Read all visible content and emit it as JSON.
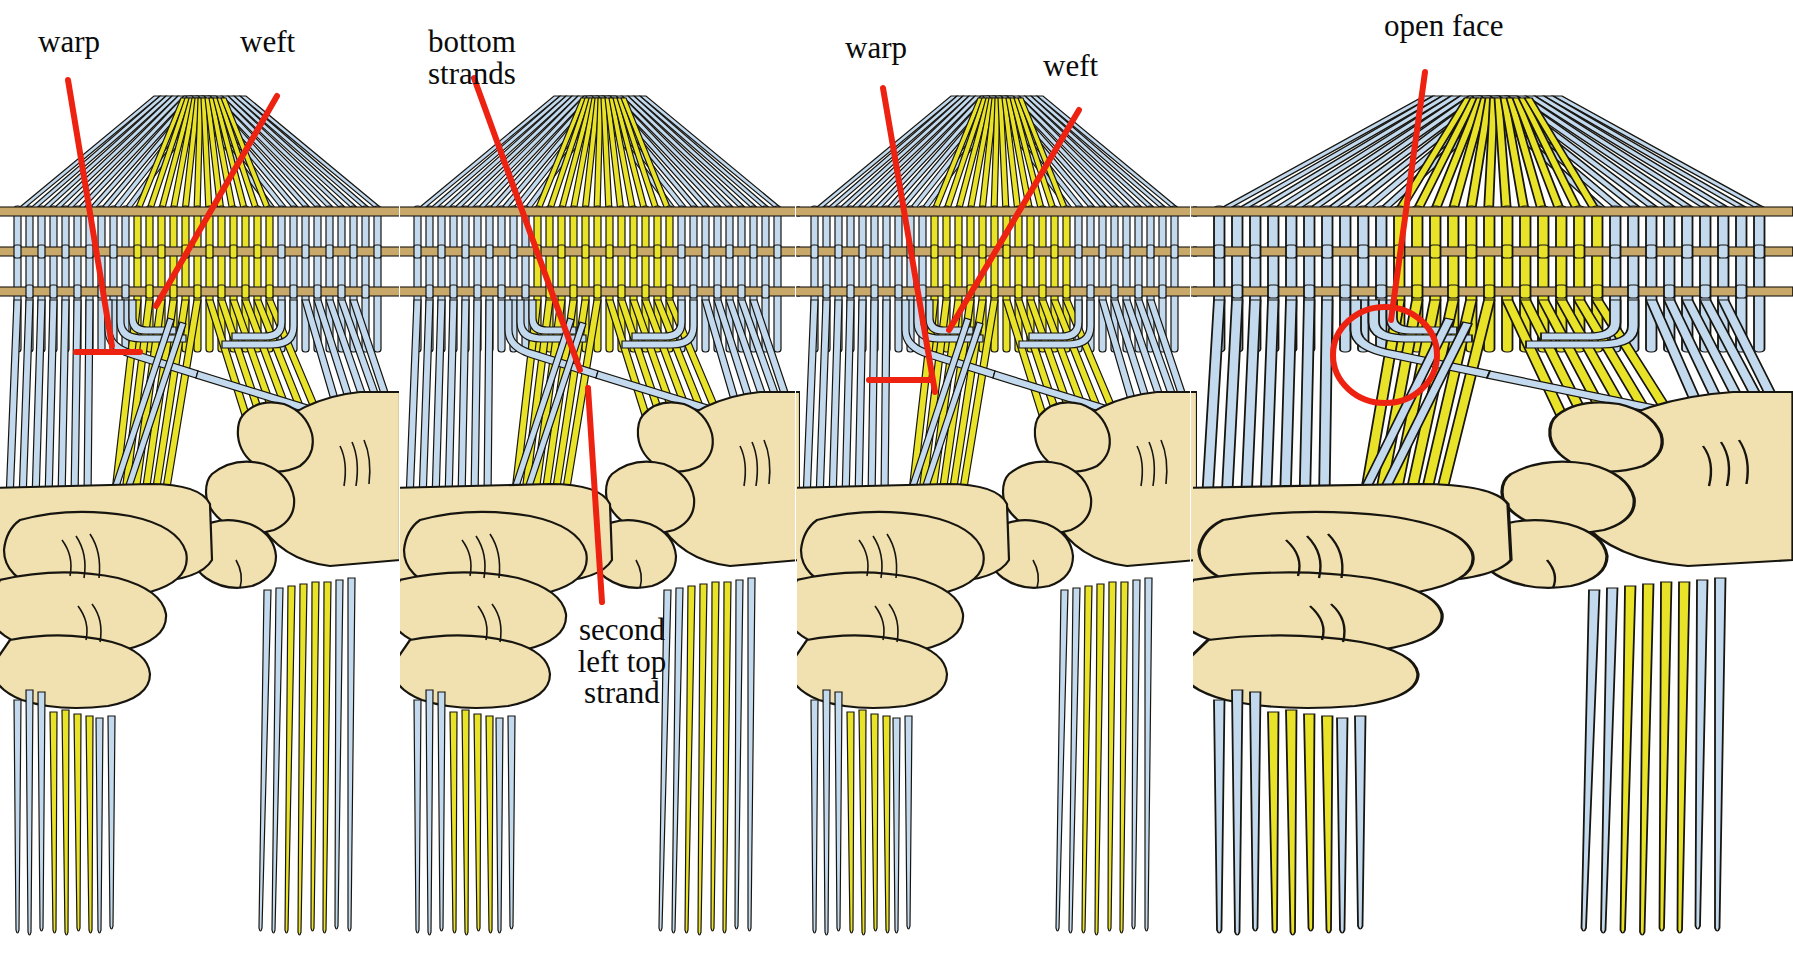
{
  "figure": {
    "panel_count": 4,
    "background_color": "#ffffff",
    "palette": {
      "warp_blue": "#c3d9ee",
      "warp_blue_shadow": "#a8c3de",
      "weft_yellow": "#e8e329",
      "weft_yellow_shadow": "#d4cf1e",
      "horizontal_weft_tan": "#c9a96a",
      "skin": "#f2e1b0",
      "skin_shadow": "#e4cf97",
      "outline": "#17150f",
      "annotation_red": "#ee2211"
    }
  },
  "panels": [
    {
      "index": 1,
      "name": "panel-warp-weft-identify",
      "labels": [
        {
          "id": "warp",
          "text": "warp",
          "x": 38,
          "y": 28
        },
        {
          "id": "weft",
          "text": "weft",
          "x": 240,
          "y": 28
        }
      ],
      "annotations": [
        {
          "id": "warp-pointer",
          "kind": "leader-line-with-tick"
        },
        {
          "id": "weft-pointer",
          "kind": "leader-line"
        }
      ]
    },
    {
      "index": 2,
      "name": "panel-bottom-strands",
      "labels": [
        {
          "id": "bottom-strands",
          "text": "bottom\nstrands",
          "x": 428,
          "y": 28
        },
        {
          "id": "second-left-top-strand",
          "text": "second\nleft top\nstrand",
          "x": 560,
          "y": 616
        }
      ],
      "annotations": [
        {
          "id": "bottom-strands-pointer",
          "kind": "leader-line"
        },
        {
          "id": "second-left-top-strand-pointer",
          "kind": "leader-line"
        }
      ]
    },
    {
      "index": 3,
      "name": "panel-warp-weft-again",
      "labels": [
        {
          "id": "warp",
          "text": "warp",
          "x": 844,
          "y": 34
        },
        {
          "id": "weft",
          "text": "weft",
          "x": 1042,
          "y": 52
        }
      ],
      "annotations": [
        {
          "id": "warp-pointer",
          "kind": "leader-line-with-tick"
        },
        {
          "id": "weft-pointer",
          "kind": "leader-line"
        }
      ]
    },
    {
      "index": 4,
      "name": "panel-open-face",
      "labels": [
        {
          "id": "open-face",
          "text": "open face",
          "x": 1384,
          "y": 12
        }
      ],
      "annotations": [
        {
          "id": "open-face-pointer",
          "kind": "leader-line"
        },
        {
          "id": "open-face-circle",
          "kind": "circle-highlight"
        }
      ]
    }
  ],
  "legend_terms": [
    "warp",
    "weft",
    "bottom strands",
    "second left top strand",
    "open face"
  ]
}
